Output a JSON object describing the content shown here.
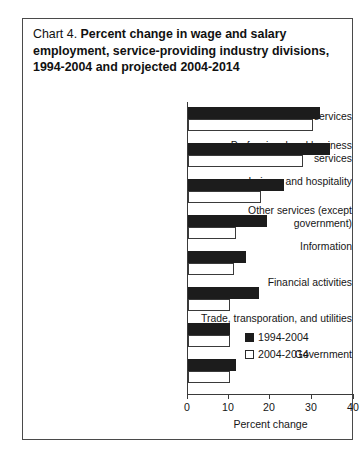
{
  "title": {
    "prefix": "Chart 4.",
    "main": "Percent change in wage and salary employment, service-providing industry divisions, 1994-2004 and projected 2004-2014"
  },
  "legend": {
    "position": "inside-bottom-right",
    "entries": [
      {
        "label": "1994-2004",
        "swatch": "filled-square",
        "color": "#1c1c1c"
      },
      {
        "label": "2004-2014",
        "swatch": "open-square",
        "color": "#ffffff"
      }
    ]
  },
  "axis": {
    "x_title": "Percent change",
    "x_ticks": [
      "0",
      "10",
      "20",
      "30",
      "40"
    ]
  },
  "chart_data": {
    "type": "bar",
    "orientation": "horizontal",
    "title": "Chart 4.  Percent change in wage and salary employment, service-providing industry divisions, 1994-2004 and projected 2004-2014",
    "xlabel": "Percent change",
    "ylabel": "",
    "xlim": [
      0,
      40
    ],
    "xticks": [
      0,
      10,
      20,
      30,
      40
    ],
    "grid": false,
    "legend_position": "inside-bottom-right",
    "categories": [
      "Education and health services",
      "Professional and business services",
      "Leisure and hospitality",
      "Other services (except government)",
      "Information",
      "Financial activities",
      "Trade, transporation, and utilities",
      "Government"
    ],
    "series": [
      {
        "name": "1994-2004",
        "values": [
          31.5,
          34,
          23,
          19,
          14,
          17,
          10,
          11.5
        ]
      },
      {
        "name": "2004-2014",
        "values": [
          30,
          27.5,
          17.5,
          11.5,
          11,
          10,
          10,
          10
        ]
      }
    ]
  }
}
